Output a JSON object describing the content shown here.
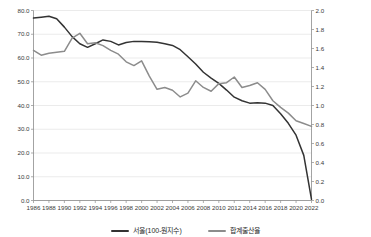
{
  "chart_data": {
    "type": "line",
    "title": "",
    "subtitle": "",
    "xlabel": "",
    "ylabel": "",
    "grid": true,
    "legend_position": "bottom-center",
    "x": [
      1986,
      1987,
      1988,
      1989,
      1990,
      1991,
      1992,
      1993,
      1994,
      1995,
      1996,
      1997,
      1998,
      1999,
      2000,
      2001,
      2002,
      2003,
      2004,
      2005,
      2006,
      2007,
      2008,
      2009,
      2010,
      2011,
      2012,
      2013,
      2014,
      2015,
      2016,
      2017,
      2018,
      2019,
      2020,
      2021,
      2022
    ],
    "xtick_labels": [
      "1986",
      "1988",
      "1990",
      "1992",
      "1994",
      "1996",
      "1998",
      "2000",
      "2002",
      "2004",
      "2006",
      "2008",
      "2010",
      "2012",
      "2014",
      "2016",
      "2018",
      "2020",
      "2022"
    ],
    "xlim": [
      1986,
      2022
    ],
    "axes": [
      {
        "id": "left",
        "ylim": [
          0.0,
          80.0
        ],
        "ytick_labels": [
          "0.0",
          "10.0",
          "20.0",
          "30.0",
          "40.0",
          "50.0",
          "60.0",
          "70.0",
          "80.0"
        ],
        "ytick_values": [
          0.0,
          10.0,
          20.0,
          30.0,
          40.0,
          50.0,
          60.0,
          70.0,
          80.0
        ]
      },
      {
        "id": "right",
        "ylim": [
          0.0,
          2.0
        ],
        "ytick_labels": [
          "0.0",
          "0.2",
          "0.4",
          "0.6",
          "0.8",
          "1.0",
          "1.2",
          "1.4",
          "1.6",
          "1.8",
          "2.0"
        ],
        "ytick_values": [
          0.0,
          0.2,
          0.4,
          0.6,
          0.8,
          1.0,
          1.2,
          1.4,
          1.6,
          1.8,
          2.0
        ]
      }
    ],
    "series": [
      {
        "name": "서울(100-원지수)",
        "axis": "left",
        "color": "#333333",
        "values": [
          76.8,
          77.2,
          77.6,
          76.5,
          73.0,
          69.0,
          66.0,
          64.5,
          66.0,
          67.6,
          67.0,
          65.5,
          66.5,
          67.0,
          67.0,
          66.8,
          66.6,
          66.0,
          65.3,
          63.5,
          60.5,
          57.5,
          54.0,
          51.5,
          49.3,
          46.5,
          43.5,
          42.0,
          41.0,
          41.2,
          41.0,
          40.0,
          36.5,
          32.5,
          27.5,
          19.0,
          0.5
        ]
      },
      {
        "name": "합계출산율",
        "axis": "right",
        "color": "#8c8c8c",
        "values": [
          1.58,
          1.53,
          1.55,
          1.56,
          1.57,
          1.71,
          1.76,
          1.65,
          1.66,
          1.63,
          1.58,
          1.54,
          1.46,
          1.42,
          1.47,
          1.31,
          1.17,
          1.19,
          1.16,
          1.09,
          1.13,
          1.26,
          1.19,
          1.15,
          1.23,
          1.24,
          1.3,
          1.19,
          1.21,
          1.24,
          1.17,
          1.05,
          0.98,
          0.92,
          0.84,
          0.81,
          0.78
        ]
      }
    ]
  },
  "legend": {
    "items": [
      {
        "label": "서울(100-원지수)",
        "color": "#333333"
      },
      {
        "label": "합계출산율",
        "color": "#8c8c8c"
      }
    ]
  }
}
